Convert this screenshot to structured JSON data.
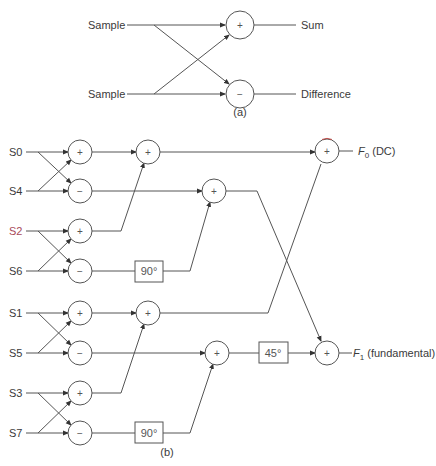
{
  "diagram_a": {
    "inputs": [
      "Sample",
      "Sample"
    ],
    "operators": [
      "+",
      "−"
    ],
    "outputs": [
      "Sum",
      "Difference"
    ],
    "caption": "(a)"
  },
  "diagram_b": {
    "inputs": [
      "S0",
      "S4",
      "S2",
      "S6",
      "S1",
      "S5",
      "S3",
      "S7"
    ],
    "stage1_ops": [
      "+",
      "−",
      "+",
      "−",
      "+",
      "−",
      "+",
      "−"
    ],
    "stage2_ops": [
      "+",
      "+",
      "+",
      "+"
    ],
    "stage3_ops": [
      "+",
      "+"
    ],
    "phase_boxes": [
      "90°",
      "90°",
      "45°"
    ],
    "outputs": {
      "f0_symbol": "F",
      "f0_sub": "0",
      "f0_desc": " (DC)",
      "f1_symbol": "F",
      "f1_sub": "1",
      "f1_desc": " (fundamental)"
    },
    "caption": "(b)"
  },
  "colors": {
    "line": "#555555",
    "text": "#3a3a3a",
    "accent_red": "#c0504d",
    "accent_blue": "#4a5a9a"
  }
}
